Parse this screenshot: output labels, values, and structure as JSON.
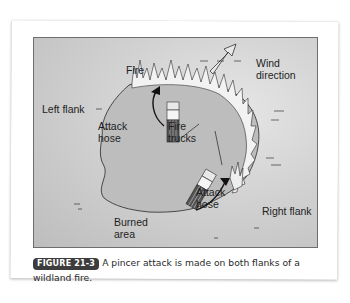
{
  "figure": {
    "labels": {
      "fire": "Fire",
      "wind_direction": "Wind direction",
      "left_flank": "Left flank",
      "attack_hose_left": "Attack\nhose",
      "fire_trucks": "Fire\ntrucks",
      "attack_hose_right": "Attack\nhose",
      "right_flank": "Right flank",
      "burned_area": "Burned\narea"
    },
    "colors": {
      "background": "#cfcfcf",
      "burned_area": "#b9b9b9",
      "frame_border": "#6e6e6e"
    }
  },
  "caption": {
    "badge": "FIGURE 21-3",
    "text": "A pincer attack is made on both flanks of a wildland fire.",
    "badge_color": "#3d3d3d"
  }
}
